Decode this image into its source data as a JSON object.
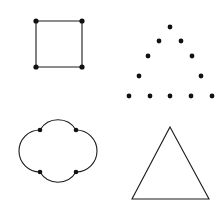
{
  "figure": {
    "background_color": "#ffffff",
    "stroke_color": "#1a1a1a",
    "dot_color": "#111111",
    "width": 222,
    "height": 209,
    "panel_count": 4
  },
  "panels": [
    {
      "id": "square-with-corner-dots",
      "label": "Square with corner dots",
      "position": "top-left",
      "shape_type": "square",
      "outline": {
        "points": "36,21 82,21 82,67 36,67",
        "closed": true
      },
      "dots": [
        {
          "cx": 36,
          "cy": 21,
          "r": 2.6
        },
        {
          "cx": 82,
          "cy": 21,
          "r": 2.6
        },
        {
          "cx": 82,
          "cy": 67,
          "r": 2.6
        },
        {
          "cx": 36,
          "cy": 67,
          "r": 2.6
        }
      ],
      "dot_count": 4
    },
    {
      "id": "dotted-triangle",
      "label": "Triangle outline drawn with dots",
      "position": "top-right",
      "shape_type": "dot-pattern-triangle",
      "outline": null,
      "rows": [
        {
          "row": 1,
          "count": 1,
          "y": 27,
          "xs": [
            170
          ]
        },
        {
          "row": 2,
          "count": 2,
          "y": 41,
          "xs": [
            159,
            181
          ]
        },
        {
          "row": 3,
          "count": 2,
          "y": 56,
          "xs": [
            148,
            192
          ]
        },
        {
          "row": 4,
          "count": 2,
          "y": 76,
          "xs": [
            139,
            201
          ]
        },
        {
          "row": 5,
          "count": 5,
          "y": 96,
          "xs": [
            129,
            150,
            170,
            191,
            212
          ]
        }
      ],
      "dots": [
        {
          "cx": 170,
          "cy": 27,
          "r": 2.4
        },
        {
          "cx": 159,
          "cy": 41,
          "r": 2.4
        },
        {
          "cx": 181,
          "cy": 41,
          "r": 2.4
        },
        {
          "cx": 148,
          "cy": 56,
          "r": 2.4
        },
        {
          "cx": 192,
          "cy": 56,
          "r": 2.4
        },
        {
          "cx": 139,
          "cy": 76,
          "r": 2.4
        },
        {
          "cx": 201,
          "cy": 76,
          "r": 2.4
        },
        {
          "cx": 129,
          "cy": 96,
          "r": 2.4
        },
        {
          "cx": 150,
          "cy": 96,
          "r": 2.4
        },
        {
          "cx": 170,
          "cy": 96,
          "r": 2.4
        },
        {
          "cx": 191,
          "cy": 96,
          "r": 2.4
        },
        {
          "cx": 212,
          "cy": 96,
          "r": 2.4
        }
      ],
      "dot_count": 12
    },
    {
      "id": "quatrefoil-with-corner-dots",
      "label": "Quatrefoil with corner dots",
      "position": "bottom-left",
      "shape_type": "quatrefoil",
      "outline": {
        "path": "M 40 130 A 21 21 0 0 1 76 130 A 21 21 0 0 1 76 172 A 21 21 0 0 1 40 172 A 21 21 0 0 1 40 130 Z",
        "closed": true,
        "inner_square": "40,130 76,130 76,172 40,172",
        "lobe_count": 4
      },
      "dots": [
        {
          "cx": 40,
          "cy": 130,
          "r": 2.3
        },
        {
          "cx": 76,
          "cy": 130,
          "r": 2.3
        },
        {
          "cx": 76,
          "cy": 172,
          "r": 2.3
        },
        {
          "cx": 40,
          "cy": 172,
          "r": 2.3
        }
      ],
      "dot_count": 4
    },
    {
      "id": "plain-triangle",
      "label": "Plain triangle outline",
      "position": "bottom-right",
      "shape_type": "triangle",
      "outline": {
        "points": "170,127 209,199 132,199",
        "closed": true
      },
      "dots": [],
      "dot_count": 0
    }
  ]
}
